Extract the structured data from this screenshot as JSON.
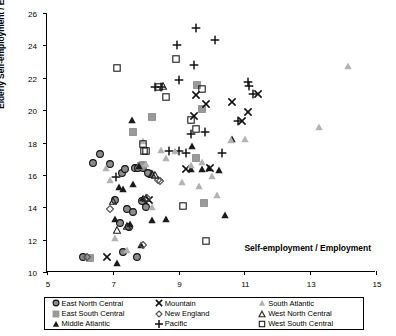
{
  "chart_data": {
    "type": "scatter",
    "title": "",
    "xlabel": "Self-employment / Employment",
    "ylabel": "Elderly Self-employment / Elderly Employment",
    "xlim": [
      5,
      15
    ],
    "ylim": [
      10,
      26
    ],
    "xticks": [
      5,
      7,
      9,
      11,
      13,
      15
    ],
    "yticks": [
      10,
      12,
      14,
      16,
      18,
      20,
      22,
      24,
      26
    ],
    "grid": false,
    "legend_position": "bottom",
    "series": [
      {
        "name": "East North Central",
        "marker": "circle-gray-filled",
        "color": "#8c8c8c",
        "points": [
          [
            6.1,
            10.95
          ],
          [
            6.62,
            17.3
          ],
          [
            6.4,
            16.75
          ],
          [
            6.92,
            16.7
          ],
          [
            7.08,
            14.45
          ],
          [
            7.22,
            13.0
          ],
          [
            7.28,
            16.1
          ],
          [
            7.38,
            16.35
          ],
          [
            7.42,
            13.9
          ],
          [
            7.48,
            12.8
          ],
          [
            7.62,
            13.7
          ],
          [
            7.68,
            16.4
          ],
          [
            7.78,
            16.45
          ],
          [
            7.9,
            16.55
          ],
          [
            7.88,
            14.4
          ],
          [
            7.92,
            16.45
          ],
          [
            7.3,
            11.25
          ],
          [
            8.02,
            14.0
          ],
          [
            8.12,
            16.05
          ],
          [
            8.06,
            16.1
          ],
          [
            7.74,
            10.95
          ]
        ]
      },
      {
        "name": "East South Central",
        "marker": "square-gray-filled",
        "color": "#9a9a9a",
        "points": [
          [
            6.32,
            10.85
          ],
          [
            7.62,
            18.65
          ],
          [
            7.92,
            16.6
          ],
          [
            8.2,
            19.6
          ],
          [
            9.55,
            21.55
          ],
          [
            9.7,
            20.1
          ],
          [
            9.52,
            17.05
          ],
          [
            9.78,
            14.25
          ],
          [
            7.86,
            16.55
          ]
        ]
      },
      {
        "name": "Middle Atlantic",
        "marker": "triangle-black-filled",
        "color": "#1a1a1a",
        "points": [
          [
            7.08,
            13.25
          ],
          [
            7.18,
            15.25
          ],
          [
            7.12,
            10.55
          ],
          [
            7.32,
            15.1
          ],
          [
            7.58,
            19.4
          ],
          [
            7.62,
            15.45
          ],
          [
            7.52,
            12.95
          ],
          [
            7.8,
            16.55
          ],
          [
            7.86,
            11.65
          ],
          [
            8.18,
            13.2
          ],
          [
            8.62,
            13.3
          ],
          [
            9.42,
            17.8
          ],
          [
            9.38,
            16.35
          ],
          [
            9.72,
            16.35
          ],
          [
            9.92,
            16.45
          ],
          [
            10.22,
            16.3
          ],
          [
            10.4,
            13.5
          ],
          [
            10.62,
            18.2
          ],
          [
            7.92,
            14.6
          ]
        ]
      },
      {
        "name": "Mountain",
        "marker": "x-black",
        "color": "#111111",
        "points": [
          [
            6.82,
            10.9
          ],
          [
            8.1,
            14.45
          ],
          [
            9.22,
            16.35
          ],
          [
            9.52,
            20.95
          ],
          [
            9.48,
            19.65
          ],
          [
            9.82,
            20.35
          ],
          [
            9.95,
            16.45
          ],
          [
            10.62,
            20.5
          ],
          [
            11.12,
            19.9
          ],
          [
            11.42,
            21.0
          ],
          [
            10.92,
            19.3
          ]
        ]
      },
      {
        "name": "New England",
        "marker": "diamond-open",
        "color": "#555555",
        "points": [
          [
            6.22,
            10.92
          ],
          [
            6.92,
            13.9
          ],
          [
            7.92,
            11.65
          ],
          [
            8.42,
            15.6
          ],
          [
            8.36,
            15.7
          ],
          [
            8.05,
            14.55
          ]
        ]
      },
      {
        "name": "Pacific",
        "marker": "plus-black",
        "color": "#111111",
        "points": [
          [
            7.1,
            15.85
          ],
          [
            8.28,
            21.4
          ],
          [
            8.48,
            21.4
          ],
          [
            8.7,
            17.45
          ],
          [
            8.96,
            24.05
          ],
          [
            9.02,
            21.85
          ],
          [
            9.22,
            17.35
          ],
          [
            9.38,
            18.55
          ],
          [
            9.46,
            22.8
          ],
          [
            9.52,
            25.1
          ],
          [
            9.8,
            18.65
          ],
          [
            10.12,
            24.35
          ],
          [
            10.32,
            17.35
          ],
          [
            11.12,
            21.75
          ],
          [
            11.15,
            21.5
          ],
          [
            11.25,
            21.0
          ],
          [
            10.8,
            19.3
          ],
          [
            9.0,
            17.45
          ]
        ]
      },
      {
        "name": "South Atlantic",
        "marker": "triangle-gray-filled",
        "color": "#b2b2b2",
        "points": [
          [
            6.9,
            15.7
          ],
          [
            7.08,
            12.1
          ],
          [
            7.92,
            18.1
          ],
          [
            8.02,
            16.7
          ],
          [
            8.2,
            14.0
          ],
          [
            8.48,
            17.55
          ],
          [
            8.62,
            17.05
          ],
          [
            8.88,
            17.45
          ],
          [
            9.38,
            16.6
          ],
          [
            9.62,
            15.3
          ],
          [
            9.72,
            16.8
          ],
          [
            10.02,
            15.95
          ],
          [
            10.18,
            14.75
          ],
          [
            10.58,
            18.15
          ],
          [
            11.02,
            18.2
          ],
          [
            13.28,
            18.95
          ],
          [
            14.15,
            22.7
          ],
          [
            6.78,
            16.45
          ],
          [
            7.42,
            11.35
          ],
          [
            9.1,
            15.55
          ]
        ]
      },
      {
        "name": "West North Central",
        "marker": "triangle-open",
        "color": "#222222",
        "points": [
          [
            7.02,
            14.4
          ],
          [
            7.12,
            12.6
          ],
          [
            7.42,
            12.85
          ],
          [
            8.02,
            14.55
          ],
          [
            8.28,
            16.0
          ],
          [
            8.52,
            21.5
          ],
          [
            8.18,
            16.05
          ]
        ]
      },
      {
        "name": "West South Central",
        "marker": "square-open",
        "color": "#1a1a1a",
        "points": [
          [
            7.12,
            22.6
          ],
          [
            7.92,
            17.9
          ],
          [
            8.02,
            17.45
          ],
          [
            8.4,
            21.45
          ],
          [
            8.62,
            20.8
          ],
          [
            8.92,
            23.15
          ],
          [
            9.12,
            14.1
          ],
          [
            9.38,
            19.4
          ],
          [
            9.52,
            18.85
          ],
          [
            9.7,
            21.3
          ],
          [
            9.82,
            11.9
          ],
          [
            7.96,
            17.45
          ]
        ]
      }
    ]
  },
  "axes": {
    "y_title": "Elderly Self-employment / Elderly Employment",
    "x_title": "Self-employment / Employment",
    "y_tick_labels": [
      "26",
      "24",
      "22",
      "20",
      "18",
      "16",
      "14",
      "12",
      "10"
    ],
    "x_tick_labels": [
      "5",
      "7",
      "9",
      "11",
      "13",
      "15"
    ]
  },
  "legend": {
    "items": [
      {
        "label": "East North Central",
        "marker": "circle-gray-filled"
      },
      {
        "label": "East South Central",
        "marker": "square-gray-filled"
      },
      {
        "label": "Middle Atlantic",
        "marker": "triangle-black-filled"
      },
      {
        "label": "Mountain",
        "marker": "x-black"
      },
      {
        "label": "New England",
        "marker": "diamond-open"
      },
      {
        "label": "Pacific",
        "marker": "plus-black"
      },
      {
        "label": "South Atlantic",
        "marker": "triangle-gray-filled"
      },
      {
        "label": "West North Central",
        "marker": "triangle-open"
      },
      {
        "label": "West South Central",
        "marker": "square-open"
      }
    ]
  }
}
